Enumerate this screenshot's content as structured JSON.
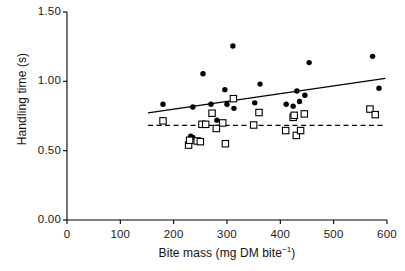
{
  "chart_data": {
    "type": "scatter",
    "title": "",
    "xlabel": "Bite mass (mg DM bite⁻¹)",
    "xlabel_main": "Bite mass (mg DM bite",
    "xlabel_sup": "−1",
    "xlabel_tail": ")",
    "ylabel": "Handling time (s)",
    "xlim": [
      0,
      600
    ],
    "ylim": [
      0.0,
      1.5
    ],
    "xticks": [
      0,
      100,
      200,
      300,
      400,
      500,
      600
    ],
    "xtick_labels": [
      "0",
      "100",
      "200",
      "300",
      "400",
      "500",
      "600"
    ],
    "yticks": [
      0.0,
      0.5,
      1.0,
      1.5
    ],
    "ytick_labels": [
      "0.00",
      "0.50",
      "1.00",
      "1.50"
    ],
    "grid": false,
    "legend": "none",
    "series": [
      {
        "name": "filled-circles",
        "marker": "filled-circle",
        "color": "#000000",
        "points": [
          [
            180,
            0.835
          ],
          [
            232,
            0.605
          ],
          [
            236,
            0.595
          ],
          [
            236,
            0.815
          ],
          [
            250,
            0.565
          ],
          [
            252,
            0.685
          ],
          [
            255,
            1.055
          ],
          [
            270,
            0.835
          ],
          [
            281,
            0.72
          ],
          [
            296,
            0.94
          ],
          [
            300,
            0.835
          ],
          [
            311,
            1.255
          ],
          [
            313,
            0.805
          ],
          [
            352,
            0.845
          ],
          [
            362,
            0.98
          ],
          [
            411,
            0.835
          ],
          [
            424,
            0.82
          ],
          [
            428,
            0.755
          ],
          [
            431,
            0.93
          ],
          [
            436,
            0.855
          ],
          [
            446,
            0.9
          ],
          [
            454,
            1.135
          ],
          [
            573,
            1.18
          ],
          [
            585,
            0.95
          ]
        ]
      },
      {
        "name": "open-squares",
        "marker": "open-square",
        "color": "#000000",
        "points": [
          [
            180,
            0.715
          ],
          [
            228,
            0.54
          ],
          [
            230,
            0.575
          ],
          [
            244,
            0.57
          ],
          [
            250,
            0.565
          ],
          [
            253,
            0.69
          ],
          [
            260,
            0.69
          ],
          [
            272,
            0.77
          ],
          [
            280,
            0.66
          ],
          [
            292,
            0.7
          ],
          [
            297,
            0.55
          ],
          [
            312,
            0.875
          ],
          [
            350,
            0.685
          ],
          [
            360,
            0.775
          ],
          [
            410,
            0.645
          ],
          [
            424,
            0.74
          ],
          [
            426,
            0.755
          ],
          [
            430,
            0.61
          ],
          [
            438,
            0.645
          ],
          [
            445,
            0.765
          ],
          [
            568,
            0.8
          ],
          [
            578,
            0.76
          ]
        ]
      }
    ],
    "trend_lines": [
      {
        "name": "solid-regression-line",
        "style": "solid",
        "color": "#000000",
        "x0": 152,
        "y0": 0.772,
        "x1": 597,
        "y1": 1.022
      },
      {
        "name": "dashed-regression-line",
        "style": "dashed",
        "color": "#000000",
        "x0": 152,
        "y0": 0.682,
        "x1": 597,
        "y1": 0.682
      }
    ]
  }
}
